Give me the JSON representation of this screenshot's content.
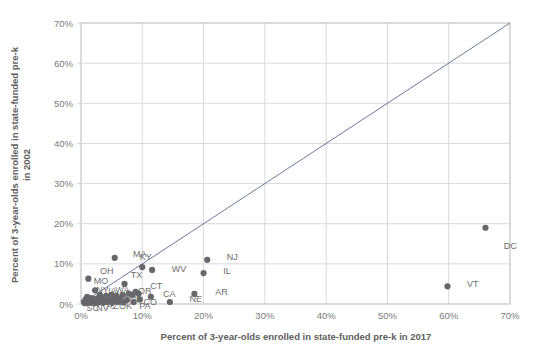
{
  "chart_data": {
    "type": "scatter",
    "title": "",
    "xlabel": "Percent of 3-year-olds enrolled in state-funded pre-k in 2017",
    "ylabel": "Percent of 3-year-olds enrolled in state-funded pre-k in 2002",
    "xlim": [
      0,
      70
    ],
    "ylim": [
      0,
      70
    ],
    "xticks": [
      "0%",
      "10%",
      "20%",
      "30%",
      "40%",
      "50%",
      "60%",
      "70%"
    ],
    "yticks": [
      "0%",
      "10%",
      "20%",
      "30%",
      "40%",
      "50%",
      "60%",
      "70%"
    ],
    "xtick_values": [
      0,
      10,
      20,
      30,
      40,
      50,
      60,
      70
    ],
    "ytick_values": [
      0,
      10,
      20,
      30,
      40,
      50,
      60,
      70
    ],
    "grid": true,
    "legend": "none",
    "annotations": [
      {
        "text": "reference-line-y-equals-x",
        "from": [
          0,
          0
        ],
        "to": [
          70,
          70
        ]
      }
    ],
    "point_color": "#66666b",
    "gridline_color": "#d9d9d9",
    "reference_line_color": "#5b6b93",
    "points": [
      {
        "label": "DC",
        "x": 66.0,
        "y": 19.0,
        "lx": 3.0,
        "ly": -4.5
      },
      {
        "label": "VT",
        "x": 59.8,
        "y": 4.4,
        "lx": 3.2,
        "ly": 0.6
      },
      {
        "label": "NJ",
        "x": 20.6,
        "y": 11.0,
        "lx": 3.2,
        "ly": 0.6
      },
      {
        "label": "IL",
        "x": 20.0,
        "y": 7.7,
        "lx": 3.2,
        "ly": 0.6
      },
      {
        "label": "AR",
        "x": 18.5,
        "y": 2.5,
        "lx": 3.4,
        "ly": 0.6
      },
      {
        "label": "NE",
        "x": 14.5,
        "y": 0.5,
        "lx": 3.2,
        "ly": 0.8
      },
      {
        "label": "MA",
        "x": 5.5,
        "y": 11.5,
        "lx": 3.0,
        "ly": 0.9
      },
      {
        "label": "KY",
        "x": 10.0,
        "y": 9.2,
        "lx": -0.4,
        "ly": 2.6
      },
      {
        "label": "WV",
        "x": 11.6,
        "y": 8.5,
        "lx": 3.2,
        "ly": 0.2
      },
      {
        "label": "OH",
        "x": 1.2,
        "y": 6.3,
        "lx": 1.9,
        "ly": 1.9
      },
      {
        "label": "TX",
        "x": 7.1,
        "y": 5.0,
        "lx": 1.0,
        "ly": 2.1
      },
      {
        "label": "MO",
        "x": 2.3,
        "y": 3.4,
        "lx": -0.2,
        "ly": 2.4
      },
      {
        "label": "CT",
        "x": 9.4,
        "y": 2.6,
        "lx": 1.9,
        "ly": 2.0
      },
      {
        "label": "OR",
        "x": 8.4,
        "y": 2.3,
        "lx": 0.9,
        "ly": 1.0
      },
      {
        "label": "CA",
        "x": 11.4,
        "y": 1.8,
        "lx": 2.0,
        "ly": 0.7
      },
      {
        "label": "NY",
        "x": 3.1,
        "y": 2.2,
        "lx": -0.6,
        "ly": 1.2
      },
      {
        "label": "IA",
        "x": 4.1,
        "y": 2.0,
        "lx": 0.3,
        "ly": 1.2
      },
      {
        "label": "WA",
        "x": 5.0,
        "y": 2.3,
        "lx": 0.6,
        "ly": 1.1
      },
      {
        "label": "NM",
        "x": 6.4,
        "y": 1.3,
        "lx": 0.3,
        "ly": 0.9
      },
      {
        "label": "ND",
        "x": 7.5,
        "y": 1.0,
        "lx": 0.4,
        "ly": 0.2
      },
      {
        "label": "CO",
        "x": 9.6,
        "y": 1.1,
        "lx": 0.6,
        "ly": -0.5
      },
      {
        "label": "PA",
        "x": 8.6,
        "y": 0.5,
        "lx": 0.9,
        "ly": -0.9
      },
      {
        "label": "OK",
        "x": 6.0,
        "y": 0.5,
        "lx": 0.2,
        "ly": -1.0
      },
      {
        "label": "AZ",
        "x": 4.3,
        "y": 0.5,
        "lx": -0.1,
        "ly": -1.1
      },
      {
        "label": "NV",
        "x": 2.8,
        "y": 0.4,
        "lx": -0.3,
        "ly": -1.3
      },
      {
        "label": "SC",
        "x": 1.5,
        "y": 0.3,
        "lx": -0.6,
        "ly": -1.4
      },
      {
        "label": "",
        "x": 0.5,
        "y": 0.6,
        "lx": 0,
        "ly": 0
      },
      {
        "label": "",
        "x": 0.8,
        "y": 1.2,
        "lx": 0,
        "ly": 0
      },
      {
        "label": "",
        "x": 1.0,
        "y": 1.8,
        "lx": 0,
        "ly": 0
      },
      {
        "label": "",
        "x": 1.3,
        "y": 0.9,
        "lx": 0,
        "ly": 0
      },
      {
        "label": "",
        "x": 1.7,
        "y": 1.5,
        "lx": 0,
        "ly": 0
      },
      {
        "label": "",
        "x": 2.0,
        "y": 0.7,
        "lx": 0,
        "ly": 0
      },
      {
        "label": "",
        "x": 2.4,
        "y": 1.2,
        "lx": 0,
        "ly": 0
      },
      {
        "label": "",
        "x": 2.9,
        "y": 1.6,
        "lx": 0,
        "ly": 0
      },
      {
        "label": "",
        "x": 3.4,
        "y": 0.8,
        "lx": 0,
        "ly": 0
      },
      {
        "label": "",
        "x": 3.8,
        "y": 1.4,
        "lx": 0,
        "ly": 0
      },
      {
        "label": "",
        "x": 4.6,
        "y": 1.0,
        "lx": 0,
        "ly": 0
      },
      {
        "label": "",
        "x": 5.4,
        "y": 1.5,
        "lx": 0,
        "ly": 0
      },
      {
        "label": "",
        "x": 5.8,
        "y": 2.0,
        "lx": 0,
        "ly": 0
      },
      {
        "label": "",
        "x": 6.8,
        "y": 2.2,
        "lx": 0,
        "ly": 0
      },
      {
        "label": "",
        "x": 7.8,
        "y": 2.6,
        "lx": 0,
        "ly": 0
      },
      {
        "label": "",
        "x": 8.9,
        "y": 3.0,
        "lx": 0,
        "ly": 0
      },
      {
        "label": "",
        "x": 0.6,
        "y": 0.2,
        "lx": 0,
        "ly": 0
      },
      {
        "label": "",
        "x": 1.1,
        "y": 0.3,
        "lx": 0,
        "ly": 0
      },
      {
        "label": "",
        "x": 2.2,
        "y": 0.2,
        "lx": 0,
        "ly": 0
      },
      {
        "label": "",
        "x": 3.6,
        "y": 0.3,
        "lx": 0,
        "ly": 0
      },
      {
        "label": "",
        "x": 5.1,
        "y": 0.3,
        "lx": 0,
        "ly": 0
      },
      {
        "label": "",
        "x": 6.9,
        "y": 0.4,
        "lx": 0,
        "ly": 0
      }
    ]
  }
}
